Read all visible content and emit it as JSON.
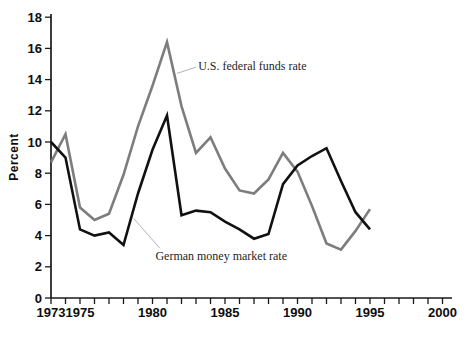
{
  "chart_data": {
    "type": "line",
    "title": "",
    "xlabel": "",
    "ylabel": "Percent",
    "grid": false,
    "legend_position": "none",
    "x_range": [
      1973,
      2000
    ],
    "ylim": [
      0,
      18
    ],
    "y_ticks": [
      0,
      2,
      4,
      6,
      8,
      10,
      12,
      14,
      16,
      18
    ],
    "x_tick_labels": [
      1973,
      1975,
      1980,
      1985,
      1990,
      1995,
      2000
    ],
    "x": [
      1973,
      1974,
      1975,
      1976,
      1977,
      1978,
      1979,
      1980,
      1981,
      1982,
      1983,
      1984,
      1985,
      1986,
      1987,
      1988,
      1989,
      1990,
      1991,
      1992,
      1993,
      1994,
      1995
    ],
    "series": [
      {
        "name": "U.S. federal funds rate",
        "color": "#7d7d7d",
        "values": [
          8.7,
          10.5,
          5.8,
          5.0,
          5.4,
          7.9,
          11.0,
          13.6,
          16.4,
          12.3,
          9.3,
          10.3,
          8.3,
          6.9,
          6.7,
          7.6,
          9.3,
          8.1,
          5.9,
          3.5,
          3.1,
          4.3,
          5.7
        ]
      },
      {
        "name": "German money market rate",
        "color": "#111111",
        "values": [
          10.0,
          9.0,
          4.4,
          4.0,
          4.2,
          3.4,
          6.7,
          9.5,
          11.7,
          5.3,
          5.6,
          5.5,
          4.9,
          4.4,
          3.8,
          4.1,
          7.3,
          8.5,
          9.1,
          9.6,
          7.5,
          5.5,
          4.4
        ]
      }
    ],
    "annotations": [
      {
        "text": "U.S. federal funds rate",
        "anchor_year": 1983.15,
        "anchor_pct": 15.3,
        "leader": {
          "x1_year": 1981.7,
          "y1_pct": 14.4,
          "x2_year": 1983.0,
          "y2_pct": 14.8
        }
      },
      {
        "text": "German money market rate",
        "anchor_year": 1980.2,
        "anchor_pct": 3.14,
        "leader": {
          "x1_year": 1978.7,
          "y1_pct": 5.1,
          "x2_year": 1980.5,
          "y2_pct": 3.2
        }
      }
    ],
    "leader_color": "#b3b3b3",
    "axis_color": "#1a1a1a",
    "tick_label_color": "#0d0d0d"
  }
}
